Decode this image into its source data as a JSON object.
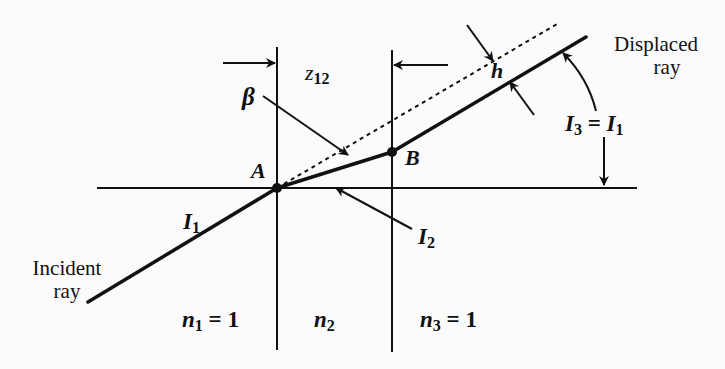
{
  "diagram": {
    "type": "optics-parallel-plate-ray-displacement",
    "labels": {
      "z12": {
        "main": "z",
        "sub": "12"
      },
      "beta": "β",
      "point_a": "A",
      "point_b": "B",
      "h": "h",
      "i1": {
        "main": "I",
        "sub": "1"
      },
      "i2": {
        "main": "I",
        "sub": "2"
      },
      "i3_eq_i1": {
        "left_main": "I",
        "left_sub": "3",
        "eq": " = ",
        "right_main": "I",
        "right_sub": "1"
      },
      "n1": {
        "main": "n",
        "sub": "1",
        "rest": " = 1"
      },
      "n2": {
        "main": "n",
        "sub": "2"
      },
      "n3": {
        "main": "n",
        "sub": "3",
        "rest": " = 1"
      },
      "incident_ray": {
        "line1": "Incident",
        "line2": "ray"
      },
      "displaced_ray": {
        "line1": "Displaced",
        "line2": "ray"
      }
    },
    "colors": {
      "ink": "#111111",
      "background": "#fbfbfb"
    }
  }
}
